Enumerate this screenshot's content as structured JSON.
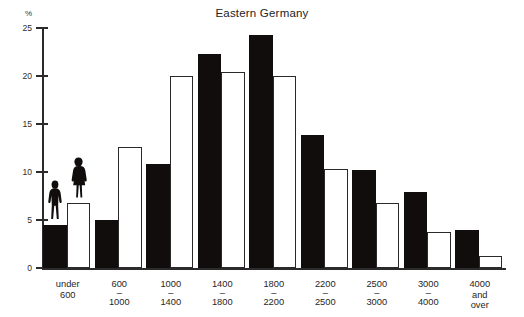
{
  "chart_data": {
    "type": "bar",
    "title": "Eastern Germany",
    "xlabel": "",
    "ylabel": "%",
    "ylim": [
      0,
      25
    ],
    "yticks": [
      0,
      5,
      10,
      15,
      20,
      25
    ],
    "ytick_labels": [
      "0",
      "5",
      "10",
      "15",
      "20",
      "25"
    ],
    "grid": false,
    "legend": "none",
    "categories": [
      "under\n600",
      "600\n–\n1000",
      "1000\n–\n1400",
      "1400\n–\n1800",
      "1800\n–\n2200",
      "2200\n–\n2500",
      "2500\n–\n3000",
      "3000\n–\n4000",
      "4000\nand\nover"
    ],
    "series": [
      {
        "name": "men",
        "color": "#100d0c",
        "style": "filled",
        "values": [
          4.5,
          5.0,
          10.8,
          22.3,
          24.3,
          13.9,
          10.2,
          7.9,
          4.0
        ]
      },
      {
        "name": "women",
        "color": "#ffffff",
        "style": "outline",
        "values": [
          6.8,
          12.6,
          20.0,
          20.4,
          20.0,
          10.3,
          6.8,
          3.7,
          1.3
        ]
      }
    ],
    "annotations": [
      {
        "name": "male-figure-pictogram",
        "category_index": 0,
        "series": "men"
      },
      {
        "name": "female-figure-pictogram",
        "category_index": 0,
        "series": "women"
      }
    ]
  },
  "categories_lines": [
    [
      "under",
      "",
      "600"
    ],
    [
      "600",
      "–",
      "1000"
    ],
    [
      "1000",
      "–",
      "1400"
    ],
    [
      "1400",
      "–",
      "1800"
    ],
    [
      "1800",
      "–",
      "2200"
    ],
    [
      "2200",
      "–",
      "2500"
    ],
    [
      "2500",
      "–",
      "3000"
    ],
    [
      "3000",
      "–",
      "4000"
    ],
    [
      "4000",
      "and",
      "over"
    ]
  ],
  "axis": {
    "percent_symbol": "%"
  },
  "colors": {
    "bar_filled": "#100d0c",
    "bar_outline_stroke": "#2a2a2a",
    "axis": "#2b2b2b",
    "background": "#ffffff",
    "text": "#262626"
  }
}
